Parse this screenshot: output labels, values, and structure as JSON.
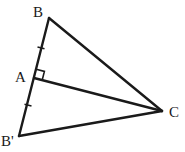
{
  "diagram": {
    "type": "geometry",
    "points": {
      "B": {
        "label": "B",
        "x": 49,
        "y": 18
      },
      "A": {
        "label": "A",
        "x": 34,
        "y": 78
      },
      "B_prime": {
        "label": "B'",
        "x": 19,
        "y": 136
      },
      "C": {
        "label": "C",
        "x": 162,
        "y": 111
      }
    },
    "segments": [
      "BA",
      "AB'",
      "BC",
      "AC",
      "B'C"
    ],
    "markers": {
      "right_angle": "at A between AB and AC",
      "equal_ticks": [
        "BA",
        "AB'"
      ]
    },
    "stroke_color": "#1a1a1a"
  }
}
